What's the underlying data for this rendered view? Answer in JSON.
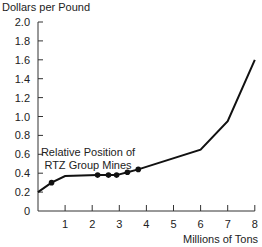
{
  "chart_data": {
    "type": "line",
    "title": "",
    "ylabel": "Dollars per Pound",
    "xlabel": "Millions of Tons",
    "xlim": [
      0,
      8
    ],
    "ylim": [
      0,
      2.0
    ],
    "x_ticks": [
      "1",
      "2",
      "3",
      "4",
      "5",
      "6",
      "7",
      "8"
    ],
    "y_ticks": [
      "0",
      "0.2",
      "0.4",
      "0.6",
      "0.8",
      "1.0",
      "1.2",
      "1.4",
      "1.6",
      "1.8",
      "2.0"
    ],
    "grid": false,
    "legend": null,
    "annotation": {
      "line1": "Relative Position of",
      "line2": "RTZ Group Mines"
    },
    "series": [
      {
        "name": "Cost curve",
        "points": [
          {
            "x": 0,
            "y": 0.2
          },
          {
            "x": 0.5,
            "y": 0.3
          },
          {
            "x": 1.0,
            "y": 0.37
          },
          {
            "x": 2.2,
            "y": 0.38
          },
          {
            "x": 2.6,
            "y": 0.38
          },
          {
            "x": 2.9,
            "y": 0.38
          },
          {
            "x": 3.3,
            "y": 0.41
          },
          {
            "x": 3.7,
            "y": 0.44
          },
          {
            "x": 6.0,
            "y": 0.65
          },
          {
            "x": 7.0,
            "y": 0.95
          },
          {
            "x": 8.0,
            "y": 1.6
          }
        ]
      }
    ],
    "highlighted_points": [
      {
        "x": 0.5,
        "y": 0.3
      },
      {
        "x": 2.2,
        "y": 0.38
      },
      {
        "x": 2.6,
        "y": 0.38
      },
      {
        "x": 2.9,
        "y": 0.38
      },
      {
        "x": 3.3,
        "y": 0.41
      },
      {
        "x": 3.7,
        "y": 0.44
      }
    ]
  }
}
